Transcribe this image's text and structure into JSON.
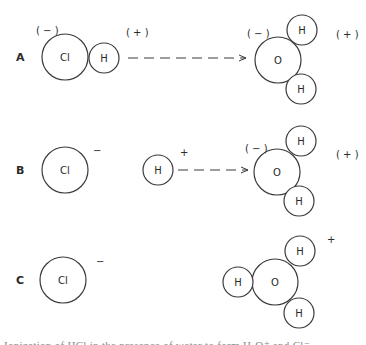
{
  "figure": {
    "rows": [
      {
        "label": "A",
        "left_molecule": {
          "atoms": [
            {
              "symbol": "Cl",
              "cx": 65,
              "cy": 57,
              "r": 23
            },
            {
              "symbol": "H",
              "cx": 104,
              "cy": 58,
              "r": 15
            }
          ],
          "charges": [
            {
              "text": "( − )",
              "x": 36,
              "y": 34
            },
            {
              "text": "( + )",
              "x": 126,
              "y": 36
            }
          ]
        },
        "arrow": {
          "x1": 128,
          "x2": 246,
          "y": 58,
          "style": "dashed"
        },
        "right_molecule": {
          "atoms": [
            {
              "symbol": "O",
              "cx": 278,
              "cy": 60,
              "r": 23
            },
            {
              "symbol": "H",
              "cx": 302,
              "cy": 30,
              "r": 15
            },
            {
              "symbol": "H",
              "cx": 301,
              "cy": 89,
              "r": 15
            }
          ],
          "charges": [
            {
              "text": "( − )",
              "x": 247,
              "y": 37
            },
            {
              "text": "( + )",
              "x": 336,
              "y": 38
            }
          ]
        }
      },
      {
        "label": "B",
        "left_molecule": {
          "atoms": [
            {
              "symbol": "Cl",
              "cx": 65,
              "cy": 170,
              "r": 23
            }
          ],
          "charges": [
            {
              "text": "−",
              "x": 93,
              "y": 154
            }
          ]
        },
        "ion": {
          "atoms": [
            {
              "symbol": "H",
              "cx": 158,
              "cy": 170,
              "r": 15
            }
          ],
          "charges": [
            {
              "text": "+",
              "x": 180,
              "y": 156
            }
          ]
        },
        "arrow": {
          "x1": 178,
          "x2": 248,
          "y": 170,
          "style": "dashed"
        },
        "right_molecule": {
          "atoms": [
            {
              "symbol": "O",
              "cx": 277,
              "cy": 172,
              "r": 23
            },
            {
              "symbol": "H",
              "cx": 301,
              "cy": 141,
              "r": 15
            },
            {
              "symbol": "H",
              "cx": 299,
              "cy": 201,
              "r": 15
            }
          ],
          "charges": [
            {
              "text": "( − )",
              "x": 245,
              "y": 152
            },
            {
              "text": "( + )",
              "x": 336,
              "y": 158
            }
          ]
        }
      },
      {
        "label": "C",
        "left_molecule": {
          "atoms": [
            {
              "symbol": "Cl",
              "cx": 63,
              "cy": 280,
              "r": 23
            }
          ],
          "charges": [
            {
              "text": "−",
              "x": 96,
              "y": 265
            }
          ]
        },
        "right_molecule": {
          "atoms": [
            {
              "symbol": "O",
              "cx": 275,
              "cy": 282,
              "r": 23
            },
            {
              "symbol": "H",
              "cx": 300,
              "cy": 251,
              "r": 15
            },
            {
              "symbol": "H",
              "cx": 299,
              "cy": 313,
              "r": 15
            },
            {
              "symbol": "H",
              "cx": 238,
              "cy": 282,
              "r": 15
            }
          ],
          "charges": [
            {
              "text": "+",
              "x": 327,
              "y": 243
            }
          ]
        }
      }
    ],
    "caption": "Ionization of HCl in the presence of water to form H₃O⁺ and Cl⁻"
  },
  "colors": {
    "stroke": "#3a3a3a",
    "text": "#2a2a2a",
    "background": "#ffffff"
  }
}
